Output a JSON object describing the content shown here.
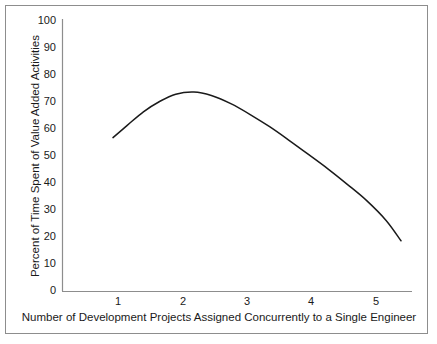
{
  "chart_data": {
    "type": "line",
    "title": "",
    "xlabel": "Number of Development Projects Assigned Concurrently to a Single Engineer",
    "ylabel": "Percent of Time Spent of Value Added Activities",
    "xlim": [
      0.0,
      5.4
    ],
    "ylim": [
      0,
      100
    ],
    "xticks": [
      1,
      2,
      3,
      4,
      5
    ],
    "xtick_labels": [
      "1",
      "2",
      "3",
      "4",
      "5"
    ],
    "yticks": [
      0,
      10,
      20,
      30,
      40,
      50,
      60,
      70,
      80,
      90,
      100
    ],
    "ytick_labels": [
      "0",
      "10",
      "20",
      "30",
      "40",
      "50",
      "60",
      "70",
      "80",
      "90",
      "100"
    ],
    "grid": false,
    "legend": null,
    "series": [
      {
        "name": "Percent of time spent on value added activities",
        "color": "#1a1a1a",
        "x": [
          0.78,
          1.0,
          1.25,
          1.5,
          1.75,
          2.03,
          2.3,
          2.6,
          2.9,
          3.2,
          3.5,
          3.8,
          4.1,
          4.4,
          4.7,
          5.0,
          5.23
        ],
        "y": [
          56.5,
          61.0,
          66.0,
          69.8,
          72.5,
          73.3,
          72.0,
          69.0,
          65.0,
          60.5,
          55.5,
          50.3,
          45.0,
          39.3,
          33.3,
          26.0,
          18.5
        ]
      }
    ],
    "annotations": []
  },
  "figure": {
    "background_color": "#ffffff",
    "border_color": "#8d8d8d",
    "axis_color": "#8d8d8d",
    "line_color": "#1a1a1a"
  }
}
